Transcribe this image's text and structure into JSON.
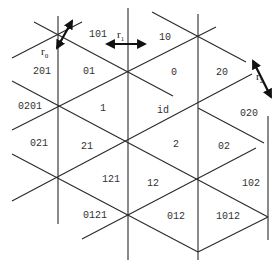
{
  "diagram": {
    "type": "triangular-tiling-coxeter-complex",
    "lines": {
      "vertical": [
        {
          "x": 58,
          "y1": 16,
          "y2": 224
        },
        {
          "x": 128,
          "y1": 8,
          "y2": 260
        },
        {
          "x": 198,
          "y1": 14,
          "y2": 260
        },
        {
          "x": 268,
          "y1": 116,
          "y2": 240
        }
      ],
      "down_right": [
        {
          "x1": 34,
          "y1": 22,
          "x2": 173,
          "y2": 96
        },
        {
          "x1": 12,
          "y1": 81,
          "x2": 268,
          "y2": 217
        },
        {
          "x1": 12,
          "y1": 154,
          "x2": 198,
          "y2": 252
        },
        {
          "x1": 152,
          "y1": 12,
          "x2": 246,
          "y2": 62
        },
        {
          "x1": 198,
          "y1": 108,
          "x2": 264,
          "y2": 143
        }
      ],
      "up_right": [
        {
          "x1": 12,
          "y1": 58,
          "x2": 82,
          "y2": 22
        },
        {
          "x1": 12,
          "y1": 130,
          "x2": 216,
          "y2": 27
        },
        {
          "x1": 12,
          "y1": 201,
          "x2": 252,
          "y2": 74
        },
        {
          "x1": 82,
          "y1": 239,
          "x2": 256,
          "y2": 148
        },
        {
          "x1": 198,
          "y1": 252,
          "x2": 268,
          "y2": 217
        }
      ]
    },
    "regions": [
      {
        "label": "101",
        "x": 89,
        "y": 37
      },
      {
        "label": "10",
        "x": 159,
        "y": 40
      },
      {
        "label": "201",
        "x": 33,
        "y": 74
      },
      {
        "label": "01",
        "x": 83,
        "y": 74
      },
      {
        "label": "0",
        "x": 171,
        "y": 75
      },
      {
        "label": "20",
        "x": 216,
        "y": 75
      },
      {
        "label": "0201",
        "x": 18,
        "y": 109
      },
      {
        "label": "1",
        "x": 100,
        "y": 111
      },
      {
        "label": "id",
        "x": 157,
        "y": 113
      },
      {
        "label": "020",
        "x": 240,
        "y": 116
      },
      {
        "label": "021",
        "x": 30,
        "y": 146
      },
      {
        "label": "21",
        "x": 81,
        "y": 149
      },
      {
        "label": "2",
        "x": 173,
        "y": 147
      },
      {
        "label": "02",
        "x": 218,
        "y": 149
      },
      {
        "label": "121",
        "x": 102,
        "y": 182
      },
      {
        "label": "12",
        "x": 147,
        "y": 186
      },
      {
        "label": "102",
        "x": 242,
        "y": 186
      },
      {
        "label": "0121",
        "x": 83,
        "y": 218
      },
      {
        "label": "012",
        "x": 167,
        "y": 219
      },
      {
        "label": "1012",
        "x": 216,
        "y": 219
      }
    ],
    "generators": [
      {
        "symbol": "r",
        "subscript": "0",
        "x": 41,
        "y": 55,
        "arrow": {
          "x1": 57,
          "y1": 48,
          "x2": 72,
          "y2": 21
        }
      },
      {
        "symbol": "r",
        "subscript": "1",
        "x": 117,
        "y": 38,
        "arrow": {
          "x1": 107,
          "y1": 44,
          "x2": 145,
          "y2": 44
        }
      },
      {
        "symbol": "r",
        "subscript": "2",
        "x": 256,
        "y": 80,
        "arrow": {
          "x1": 253,
          "y1": 61,
          "x2": 271,
          "y2": 97
        }
      }
    ]
  }
}
